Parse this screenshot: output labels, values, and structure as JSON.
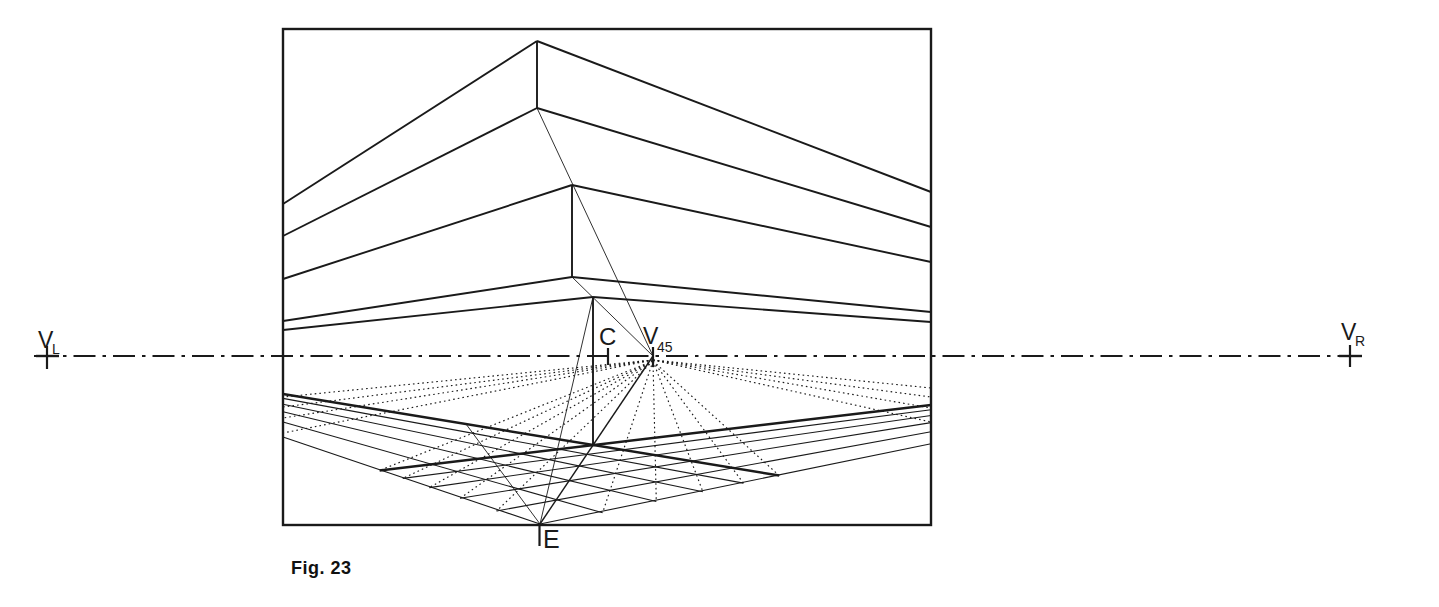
{
  "figure": {
    "caption": "Fig. 23",
    "width": 1439,
    "height": 607,
    "background": "#ffffff",
    "ink": "#1a1a1a"
  },
  "points": {
    "V_L": {
      "x": 47,
      "y": 356,
      "meaning": "left vanishing point"
    },
    "V_R": {
      "x": 1350,
      "y": 356,
      "meaning": "right vanishing point"
    },
    "C": {
      "x": 608,
      "y": 356,
      "meaning": "center of vision"
    },
    "V_45": {
      "x": 653,
      "y": 356,
      "meaning": "45-degree vanishing point"
    },
    "E": {
      "x": 539.5,
      "y": 524,
      "meaning": "station point / eye"
    },
    "G": {
      "x": 593.5,
      "y": 445,
      "meaning": "building base corner"
    }
  },
  "frame": {
    "x": 283,
    "y": 29,
    "w": 648,
    "h": 496
  },
  "styles": {
    "edge": {
      "w": 1.9,
      "dash": ""
    },
    "base": {
      "w": 2.5,
      "dash": ""
    },
    "grid": {
      "w": 1.1,
      "dash": ""
    },
    "thin": {
      "w": 0.9,
      "dash": ""
    },
    "diag": {
      "w": 1.4,
      "dash": ""
    },
    "dotted": {
      "w": 1.15,
      "dash": "1.6 3.1"
    },
    "dashdot": {
      "w": 2.2,
      "dash": "22 7 3.5 7"
    },
    "tick": {
      "w": 2.2,
      "dash": ""
    },
    "cross": {
      "w": 2.4,
      "dash": ""
    }
  },
  "style_names": {
    "edge": "building-edge",
    "base": "building-base-edge",
    "grid": "ground-grid-line",
    "thin": "construction-line",
    "diag": "diagonal-e-to-v45",
    "dotted": "dotted-45-ray",
    "dashdot": "horizon-line",
    "tick": "point-tick",
    "cross": "vanishing-point-cross"
  },
  "segments": [
    {
      "style": "dashdot",
      "x1": 34,
      "y1": 356,
      "x2": 1361,
      "y2": 356
    },
    {
      "style": "cross",
      "x1": 36,
      "y1": 356,
      "x2": 59,
      "y2": 356
    },
    {
      "style": "cross",
      "x1": 1339,
      "y1": 356,
      "x2": 1362,
      "y2": 356
    },
    {
      "style": "tick",
      "x1": 47,
      "y1": 346,
      "x2": 47,
      "y2": 369
    },
    {
      "style": "tick",
      "x1": 1350,
      "y1": 345,
      "x2": 1350,
      "y2": 367
    },
    {
      "style": "tick",
      "x1": 608,
      "y1": 348,
      "x2": 608,
      "y2": 365
    },
    {
      "style": "tick",
      "x1": 653,
      "y1": 347,
      "x2": 653,
      "y2": 367
    },
    {
      "style": "tick",
      "x1": 539.5,
      "y1": 523,
      "x2": 539.5,
      "y2": 546
    },
    {
      "style": "edge",
      "x1": 537,
      "y1": 41,
      "x2": 283,
      "y2": 204
    },
    {
      "style": "edge",
      "x1": 537,
      "y1": 41,
      "x2": 931,
      "y2": 192
    },
    {
      "style": "edge",
      "x1": 537,
      "y1": 108,
      "x2": 283,
      "y2": 236
    },
    {
      "style": "edge",
      "x1": 537,
      "y1": 108,
      "x2": 931,
      "y2": 227
    },
    {
      "style": "edge",
      "x1": 537,
      "y1": 41,
      "x2": 537,
      "y2": 108
    },
    {
      "style": "edge",
      "x1": 572,
      "y1": 185,
      "x2": 283,
      "y2": 279
    },
    {
      "style": "edge",
      "x1": 572,
      "y1": 185,
      "x2": 931,
      "y2": 262
    },
    {
      "style": "edge",
      "x1": 572,
      "y1": 277,
      "x2": 283,
      "y2": 321
    },
    {
      "style": "edge",
      "x1": 572,
      "y1": 277,
      "x2": 931,
      "y2": 312
    },
    {
      "style": "edge",
      "x1": 572,
      "y1": 185,
      "x2": 572,
      "y2": 277
    },
    {
      "style": "edge",
      "x1": 593,
      "y1": 297,
      "x2": 283,
      "y2": 330
    },
    {
      "style": "edge",
      "x1": 593,
      "y1": 297,
      "x2": 931,
      "y2": 322
    },
    {
      "style": "edge",
      "x1": 593,
      "y1": 297,
      "x2": 593,
      "y2": 445
    },
    {
      "style": "base",
      "x1": 283,
      "y1": 394,
      "x2": 779.2,
      "y2": 475.6
    },
    {
      "style": "base",
      "x1": 931,
      "y1": 405,
      "x2": 379.6,
      "y2": 470.4
    },
    {
      "style": "grid",
      "x1": 283,
      "y1": 437,
      "x2": 540,
      "y2": 524
    },
    {
      "style": "grid",
      "x1": 283,
      "y1": 422,
      "x2": 602.6,
      "y2": 512.8
    },
    {
      "style": "grid",
      "x1": 283,
      "y1": 411.7,
      "x2": 656.3,
      "y2": 501.5
    },
    {
      "style": "grid",
      "x1": 283,
      "y1": 404.2,
      "x2": 702.9,
      "y2": 491.7
    },
    {
      "style": "grid",
      "x1": 283,
      "y1": 398.4,
      "x2": 743.4,
      "y2": 483.1
    },
    {
      "style": "grid",
      "x1": 931,
      "y1": 443.7,
      "x2": 540,
      "y2": 524
    },
    {
      "style": "grid",
      "x1": 931,
      "y1": 431.8,
      "x2": 496.6,
      "y2": 511
    },
    {
      "style": "grid",
      "x1": 931,
      "y1": 422.6,
      "x2": 460.2,
      "y2": 498.3
    },
    {
      "style": "grid",
      "x1": 931,
      "y1": 415.5,
      "x2": 429.3,
      "y2": 487.6
    },
    {
      "style": "grid",
      "x1": 931,
      "y1": 409.7,
      "x2": 402.7,
      "y2": 478.4
    },
    {
      "style": "thin",
      "x1": 537,
      "y1": 108,
      "x2": 653,
      "y2": 356
    },
    {
      "style": "thin",
      "x1": 572,
      "y1": 277,
      "x2": 653,
      "y2": 356
    },
    {
      "style": "thin",
      "x1": 540,
      "y1": 524,
      "x2": 593,
      "y2": 297
    },
    {
      "style": "thin",
      "x1": 540,
      "y1": 524,
      "x2": 466,
      "y2": 424
    },
    {
      "style": "diag",
      "x1": 653,
      "y1": 356,
      "x2": 540,
      "y2": 524
    },
    {
      "style": "dotted",
      "x1": 653,
      "y1": 361,
      "x2": 496.6,
      "y2": 511
    },
    {
      "style": "dotted",
      "x1": 653,
      "y1": 361,
      "x2": 460.2,
      "y2": 498.3
    },
    {
      "style": "dotted",
      "x1": 653,
      "y1": 361,
      "x2": 429.3,
      "y2": 487.6
    },
    {
      "style": "dotted",
      "x1": 653,
      "y1": 361,
      "x2": 402.7,
      "y2": 478.4
    },
    {
      "style": "dotted",
      "x1": 653,
      "y1": 361,
      "x2": 379.6,
      "y2": 470.4
    },
    {
      "style": "dotted",
      "x1": 653,
      "y1": 360,
      "x2": 283,
      "y2": 397
    },
    {
      "style": "dotted",
      "x1": 653,
      "y1": 360,
      "x2": 283,
      "y2": 407
    },
    {
      "style": "dotted",
      "x1": 653,
      "y1": 360,
      "x2": 283,
      "y2": 418
    },
    {
      "style": "dotted",
      "x1": 653,
      "y1": 360,
      "x2": 283,
      "y2": 433
    },
    {
      "style": "dotted",
      "x1": 653,
      "y1": 361,
      "x2": 602.6,
      "y2": 512.8
    },
    {
      "style": "dotted",
      "x1": 653,
      "y1": 361,
      "x2": 656.3,
      "y2": 501.5
    },
    {
      "style": "dotted",
      "x1": 653,
      "y1": 361,
      "x2": 702.9,
      "y2": 491.7
    },
    {
      "style": "dotted",
      "x1": 653,
      "y1": 361,
      "x2": 743.4,
      "y2": 483.1
    },
    {
      "style": "dotted",
      "x1": 653,
      "y1": 361,
      "x2": 779.2,
      "y2": 475.6
    },
    {
      "style": "dotted",
      "x1": 653,
      "y1": 360,
      "x2": 931,
      "y2": 388
    },
    {
      "style": "dotted",
      "x1": 653,
      "y1": 360,
      "x2": 931,
      "y2": 397
    },
    {
      "style": "dotted",
      "x1": 653,
      "y1": 360,
      "x2": 931,
      "y2": 408
    },
    {
      "style": "dotted",
      "x1": 653,
      "y1": 360,
      "x2": 931,
      "y2": 422
    }
  ],
  "labels": [
    {
      "id": "v-left",
      "main": "V",
      "sub": "L",
      "x": 38,
      "y": 348,
      "size": 23,
      "sx": 52,
      "sy": 354,
      "sub_size": 14
    },
    {
      "id": "v-right",
      "main": "V",
      "sub": "R",
      "x": 1341,
      "y": 340,
      "size": 23,
      "sx": 1355,
      "sy": 346,
      "sub_size": 14
    },
    {
      "id": "center-c",
      "main": "C",
      "sub": "",
      "x": 599,
      "y": 345,
      "size": 24,
      "sx": 0,
      "sy": 0,
      "sub_size": 0
    },
    {
      "id": "v-45",
      "main": "V",
      "sub": "45",
      "x": 643,
      "y": 344,
      "size": 23,
      "sx": 657,
      "sy": 352,
      "sub_size": 14
    },
    {
      "id": "eye-e",
      "main": "E",
      "sub": "",
      "x": 543,
      "y": 548,
      "size": 25,
      "sx": 0,
      "sy": 0,
      "sub_size": 0
    }
  ]
}
